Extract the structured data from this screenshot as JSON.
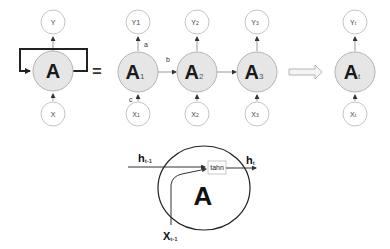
{
  "diagram": {
    "folded": {
      "cell": {
        "label": "A",
        "sub": ""
      },
      "output": {
        "label": "Y",
        "sub": ""
      },
      "input": {
        "label": "X",
        "sub": ""
      }
    },
    "equals": "=",
    "unrolled": [
      {
        "cell": {
          "label": "A",
          "sub": "1"
        },
        "output": {
          "label": "Y",
          "sub": "1"
        },
        "input": {
          "label": "X",
          "sub": "1"
        }
      },
      {
        "cell": {
          "label": "A",
          "sub": "2"
        },
        "output": {
          "label": "Y",
          "sub": "2"
        },
        "input": {
          "label": "X",
          "sub": "2"
        }
      },
      {
        "cell": {
          "label": "A",
          "sub": "3"
        },
        "output": {
          "label": "Y",
          "sub": "3"
        },
        "input": {
          "label": "X",
          "sub": "3"
        }
      }
    ],
    "final": {
      "cell": {
        "label": "A",
        "sub": "t"
      },
      "output": {
        "label": "Y",
        "sub": "t"
      },
      "input": {
        "label": "X",
        "sub": "t"
      }
    },
    "edge_labels": {
      "a": "a",
      "b": "b",
      "c": "c"
    },
    "cell_detail": {
      "cell_label": "A",
      "h_prev": {
        "label": "h",
        "sub": "t-1"
      },
      "h_out": {
        "label": "h",
        "sub": "t"
      },
      "x_in": {
        "label": "X",
        "sub": "t-1"
      },
      "activation": "tahn"
    },
    "colors": {
      "node_fill": "#e6e6e6",
      "node_stroke": "#b4b4b4",
      "line": "#222222"
    }
  }
}
